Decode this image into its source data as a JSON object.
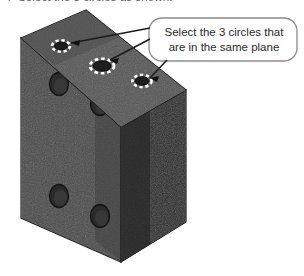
{
  "instruction": {
    "marker": "4",
    "text": "Select the 3 circles as shown.",
    "color": "#5e5e5e"
  },
  "callout": {
    "line1": "Select the 3 circles that",
    "line2": "are in the same plane",
    "border_color": "#8c8c8c",
    "fill_color": "#ffffff",
    "text_color": "#2b2b2b",
    "leader_count": "3"
  },
  "illustration": {
    "kind": "isometric-rectangular-plate",
    "top_face_color": "#4a4a4a",
    "front_face_color": "#454545",
    "side_face_color": "#2e2e2e",
    "edge_color": "#1b1b1b",
    "hole_color": "#262626",
    "highlight_color": "#ffffff",
    "selected_holes": [
      {
        "id": "top-hole-1",
        "cx": 61,
        "cy": 46,
        "rx": 8,
        "ry": 5,
        "selected": true
      },
      {
        "id": "top-hole-2",
        "cx": 102,
        "cy": 66,
        "rx": 11,
        "ry": 7,
        "selected": true
      },
      {
        "id": "top-hole-3",
        "cx": 142,
        "cy": 81,
        "rx": 9,
        "ry": 5.5,
        "selected": true
      }
    ],
    "front_holes": [
      {
        "id": "front-hole-1",
        "cx": 59,
        "cy": 84,
        "rx": 9,
        "ry": 11
      },
      {
        "id": "front-hole-2",
        "cx": 100,
        "cy": 104,
        "rx": 9,
        "ry": 11
      },
      {
        "id": "front-hole-3",
        "cx": 59,
        "cy": 196,
        "rx": 9,
        "ry": 11
      },
      {
        "id": "front-hole-4",
        "cx": 100,
        "cy": 216,
        "rx": 9,
        "ry": 11
      }
    ]
  }
}
